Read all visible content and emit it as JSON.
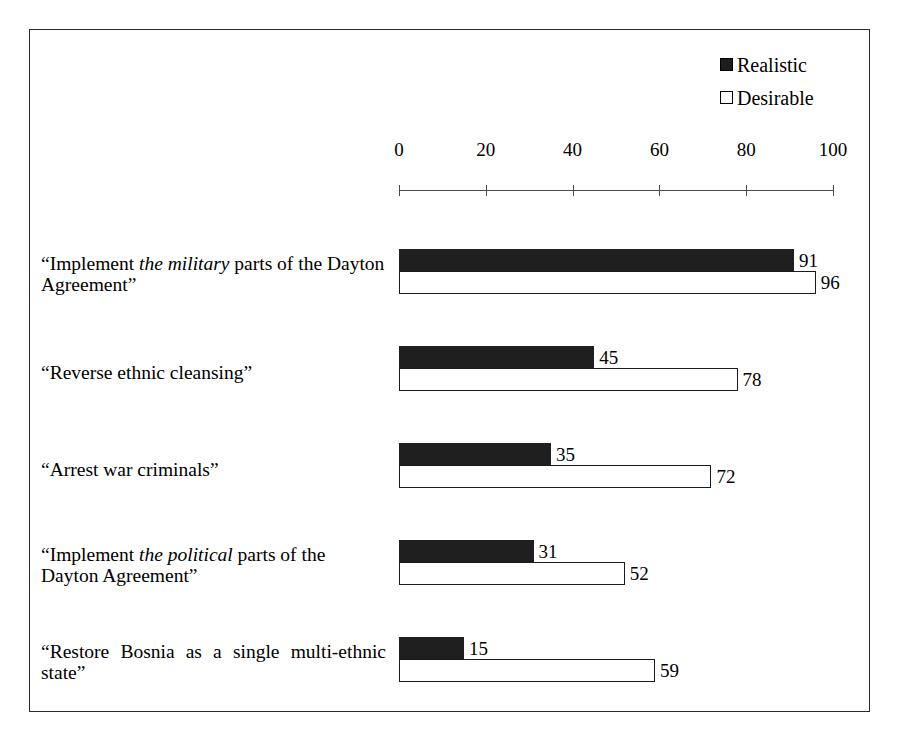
{
  "chart_data": {
    "type": "bar",
    "orientation": "horizontal",
    "title": "",
    "xlabel": "",
    "ylabel": "",
    "xlim": [
      0,
      100
    ],
    "xticks": [
      0,
      20,
      40,
      60,
      80,
      100
    ],
    "xtick_labels": [
      "0",
      "20",
      "40",
      "60",
      "80",
      "100"
    ],
    "grid": false,
    "legend_position": "top-right",
    "legend": [
      {
        "name": "Realistic",
        "swatch": "filled",
        "color": "#1f1f1f"
      },
      {
        "name": "Desirable",
        "swatch": "hollow",
        "color": "#ffffff"
      }
    ],
    "categories": [
      "“Implement the military parts of the Dayton Agreement”",
      "“Reverse ethnic cleansing”",
      "“Arrest war criminals”",
      "“Implement the political parts of the Dayton Agreement”",
      "“Restore Bosnia as a single multi-ethnic state”"
    ],
    "series": [
      {
        "name": "Realistic",
        "values": [
          91,
          45,
          35,
          31,
          15
        ]
      },
      {
        "name": "Desirable",
        "values": [
          96,
          78,
          72,
          52,
          59
        ]
      }
    ]
  },
  "legend": {
    "realistic": "Realistic",
    "desirable": "Desirable"
  },
  "axis": {
    "ticks": [
      {
        "label": "0",
        "value": 0
      },
      {
        "label": "20",
        "value": 20
      },
      {
        "label": "40",
        "value": 40
      },
      {
        "label": "60",
        "value": 60
      },
      {
        "label": "80",
        "value": 80
      },
      {
        "label": "100",
        "value": 100
      }
    ]
  },
  "groups": [
    {
      "label_html": "“Implement <i>the military</i> parts of the Dayton Agreement”",
      "label_text": "“Implement the military parts of the Dayton Agreement”",
      "lines": 2,
      "justified": false,
      "realistic": {
        "value": 91,
        "label": "91"
      },
      "desirable": {
        "value": 96,
        "label": "96"
      }
    },
    {
      "label_html": "“Reverse ethnic cleansing”",
      "label_text": "“Reverse ethnic cleansing”",
      "lines": 1,
      "justified": false,
      "realistic": {
        "value": 45,
        "label": "45"
      },
      "desirable": {
        "value": 78,
        "label": "78"
      }
    },
    {
      "label_html": "“Arrest war criminals”",
      "label_text": "“Arrest war criminals”",
      "lines": 1,
      "justified": false,
      "realistic": {
        "value": 35,
        "label": "35"
      },
      "desirable": {
        "value": 72,
        "label": "72"
      }
    },
    {
      "label_html": "“Implement <i>the political</i> parts of the Dayton Agreement”",
      "label_text": "“Implement the political parts of the Dayton Agreement”",
      "lines": 2,
      "justified": false,
      "realistic": {
        "value": 31,
        "label": "31"
      },
      "desirable": {
        "value": 52,
        "label": "52"
      }
    },
    {
      "label_html": "“Restore Bosnia as a single multi-ethnic state”",
      "label_text": "“Restore Bosnia as a single multi-ethnic state”",
      "lines": 2,
      "justified": true,
      "realistic": {
        "value": 15,
        "label": "15"
      },
      "desirable": {
        "value": 59,
        "label": "59"
      }
    }
  ]
}
